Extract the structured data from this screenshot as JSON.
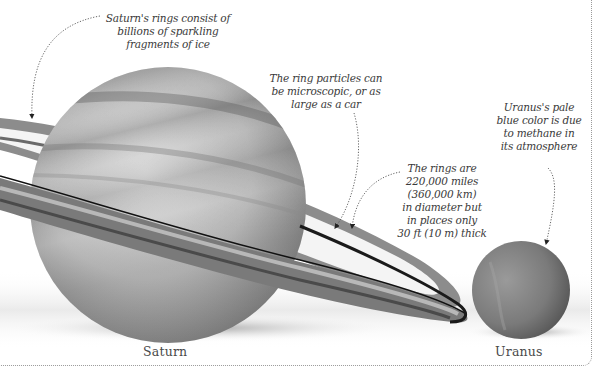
{
  "figure": {
    "planets": [
      {
        "name": "Saturn",
        "label": "Saturn"
      },
      {
        "name": "Uranus",
        "label": "Uranus"
      }
    ],
    "callouts": {
      "rings_ice": "Saturn's rings consist of\nbillions of sparkling\nfragments of ice",
      "ring_particles": "The ring particles can\nbe microscopic, or as\nlarge as a car",
      "ring_size": "The rings are\n220,000 miles\n(360,000 km)\nin diameter but\nin places only\n30 ft (10 m) thick",
      "uranus_color": "Uranus's pale\nblue color is due\nto methane in\nits atmosphere"
    },
    "colors": {
      "background": "#ffffff",
      "saturn_light": "#c9c9c9",
      "saturn_dark": "#6e6e6e",
      "ring_dark": "#1e1e1e",
      "uranus": "#7a7a7a",
      "leader_line": "#555555",
      "frame": "#9a9a9a"
    }
  }
}
